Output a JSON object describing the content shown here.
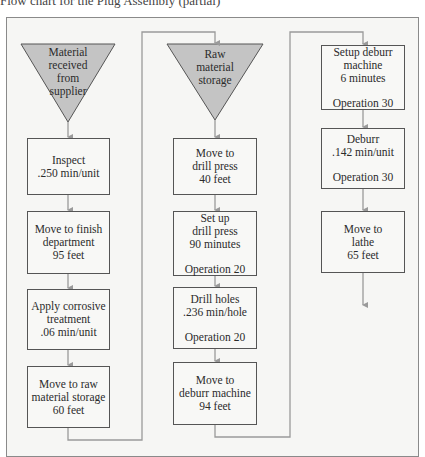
{
  "caption": "Flow chart for the Plug Assembly (partial)",
  "colors": {
    "frame_border": "#8a8a8a",
    "frame_bg": "#f6f6f4",
    "triangle_fill": "#c4c4c4",
    "connector": "#9a9a9a",
    "box_border": "#555555"
  },
  "columns": [
    {
      "storage": {
        "lines": [
          "Material",
          "received",
          "from",
          "supplier"
        ]
      },
      "steps": [
        {
          "lines": [
            "Inspect",
            ".250 min/unit"
          ]
        },
        {
          "lines": [
            "Move to finish",
            "department",
            "95 feet"
          ]
        },
        {
          "lines": [
            "Apply corrosive",
            "treatment",
            ".06 min/unit"
          ]
        },
        {
          "lines": [
            "Move to raw",
            "material storage",
            "60 feet"
          ]
        }
      ]
    },
    {
      "storage": {
        "lines": [
          "Raw",
          "material",
          "storage"
        ]
      },
      "steps": [
        {
          "lines": [
            "Move to",
            "drill press",
            "40 feet"
          ]
        },
        {
          "lines": [
            "Set up",
            "drill press",
            "90 minutes"
          ],
          "operation": "Operation 20"
        },
        {
          "lines": [
            "Drill holes",
            ".236 min/hole"
          ],
          "operation": "Operation 20"
        },
        {
          "lines": [
            "Move to",
            "deburr machine",
            "94 feet"
          ]
        }
      ]
    },
    {
      "steps": [
        {
          "lines": [
            "Setup deburr",
            "machine",
            "6 minutes"
          ],
          "operation": "Operation 30"
        },
        {
          "lines": [
            "Deburr",
            ".142 min/unit"
          ],
          "operation": "Operation 30"
        },
        {
          "lines": [
            "Move to",
            "lathe",
            "65 feet"
          ]
        }
      ]
    }
  ]
}
